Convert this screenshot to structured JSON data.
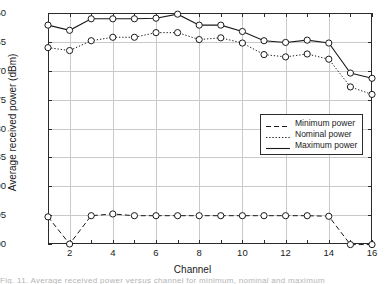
{
  "figure": {
    "background": "#ffffff",
    "foreground": "#1a1a1a",
    "grid_color": "#c9c9c9",
    "caption_partial": "Fig. 11.  Average received power versus channel for minimum, nominal and maximum"
  },
  "chart_data": {
    "type": "line",
    "title": "",
    "xlabel": "Channel",
    "ylabel": "Average received power (dBm)",
    "x": [
      1,
      2,
      3,
      4,
      5,
      6,
      7,
      8,
      9,
      10,
      11,
      12,
      13,
      14,
      15,
      16
    ],
    "xlim": [
      1,
      16
    ],
    "ylim": [
      -100,
      -60
    ],
    "xticks": [
      1,
      2,
      3,
      4,
      5,
      6,
      7,
      8,
      9,
      10,
      11,
      12,
      13,
      14,
      15,
      16
    ],
    "xticklabels": [
      "",
      "2",
      "",
      "4",
      "",
      "6",
      "",
      "8",
      "",
      "10",
      "",
      "12",
      "",
      "14",
      "",
      "16"
    ],
    "yticks": [
      -60,
      -65,
      -70,
      -75,
      -80,
      -85,
      -90,
      -95,
      -100
    ],
    "yticklabels": [
      "−100",
      "−95",
      "−90",
      "−85",
      "−80",
      "−75",
      "−70",
      "−65",
      "−60"
    ],
    "grid": true,
    "legend_position": "center-right",
    "marker": "circle-open",
    "series": [
      {
        "name": "Minimum power",
        "style": "dashed",
        "values": [
          -95.3,
          -100.0,
          -95.1,
          -94.8,
          -95.1,
          -95.1,
          -95.1,
          -95.1,
          -95.1,
          -95.1,
          -95.1,
          -95.1,
          -95.1,
          -95.2,
          -100.1,
          -100.1
        ]
      },
      {
        "name": "Nominal power",
        "style": "dotted",
        "values": [
          -66.0,
          -66.5,
          -64.8,
          -64.2,
          -64.2,
          -63.4,
          -63.4,
          -64.6,
          -64.3,
          -65.2,
          -67.2,
          -67.6,
          -67.1,
          -68.0,
          -72.8,
          -74.1
        ]
      },
      {
        "name": "Maximum power",
        "style": "solid",
        "values": [
          -62.1,
          -63.0,
          -61.0,
          -61.0,
          -61.0,
          -60.9,
          -60.2,
          -62.1,
          -62.1,
          -63.2,
          -64.8,
          -65.1,
          -64.7,
          -65.2,
          -70.4,
          -71.3
        ]
      }
    ]
  },
  "legend": {
    "items": [
      {
        "label": "Minimum power",
        "style": "dashed"
      },
      {
        "label": "Nominal power",
        "style": "dotted"
      },
      {
        "label": "Maximum power",
        "style": "solid"
      }
    ]
  }
}
